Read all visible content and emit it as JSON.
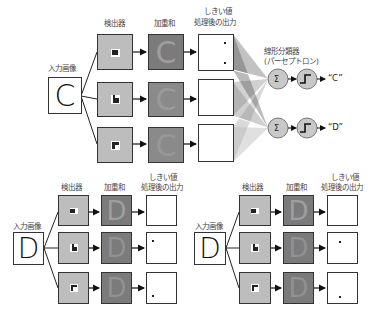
{
  "top": {
    "input_label": "入力画像",
    "input_letter": "C",
    "detector_label": "検出器",
    "weighted_sum_label": "加重和",
    "threshold_label_line1": "しきい値",
    "threshold_label_line2": "処理後の出力",
    "classifier_label_line1": "線形分類器",
    "classifier_label_line2": "(パーセプトロン)",
    "sum_symbol": "Σ",
    "outputs": [
      "“C”",
      "“D”"
    ]
  },
  "bottom_left": {
    "input_label": "入力画像",
    "input_letter": "D",
    "detector_label": "検出器",
    "weighted_sum_label": "加重和",
    "threshold_label_line1": "しきい値",
    "threshold_label_line2": "処理後の出力"
  },
  "bottom_right": {
    "input_label": "入力画像",
    "input_letter": "D",
    "detector_label": "検出器",
    "weighted_sum_label": "加重和",
    "threshold_label_line1": "しきい値",
    "threshold_label_line2": "処理後の出力"
  },
  "colors": {
    "detector_bg": "#bdbdbd",
    "weighted_sum_bg": "#7b7b7b",
    "node_fill": "#c8c8c8",
    "stroke": "#333333"
  }
}
